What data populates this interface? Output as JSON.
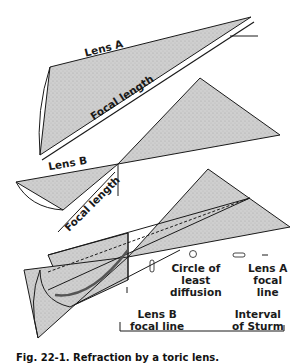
{
  "diagram": {
    "lens_a": {
      "label": "Lens A",
      "focal_label": "Focal length"
    },
    "lens_b": {
      "label": "Lens B",
      "focal_label": "Focal length"
    },
    "combined": {
      "labels": {
        "circle_of_least_diffusion": "Circle of\nleast\ndiffusion",
        "lens_a_focal_line": "Lens A\nfocal\nline",
        "lens_b_focal_line": "Lens B\nfocal line",
        "interval_of_sturm": "Interval\nof Sturm"
      }
    },
    "colors": {
      "shade": "#c8c8c8",
      "stroke": "#1a1a1a",
      "background": "#ffffff"
    }
  },
  "caption": "Fig. 22-1. Refraction by a toric lens."
}
